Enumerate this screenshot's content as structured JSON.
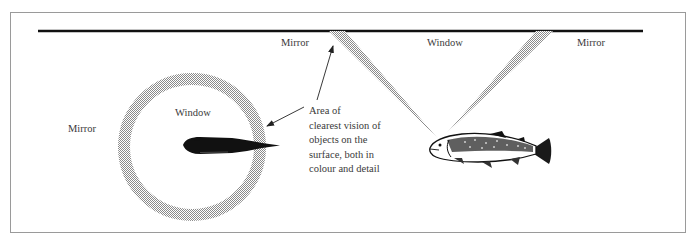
{
  "diagram": {
    "type": "illustration",
    "left_panel": {
      "view": "from above",
      "labels": {
        "mirror": "Mirror",
        "window": "Window"
      }
    },
    "right_panel": {
      "view": "side section",
      "labels": {
        "mirror_left": "Mirror",
        "window": "Window",
        "mirror_right": "Mirror"
      }
    },
    "annotation": {
      "lines": [
        "Area of",
        "clearest vision of",
        "objects on the",
        "surface, both in",
        "colour and detail"
      ]
    },
    "colors": {
      "line": "#111111",
      "hatch": "#9a9a9a",
      "text": "#3a3a3a",
      "frame": "#9a9a9a"
    }
  }
}
